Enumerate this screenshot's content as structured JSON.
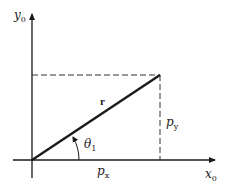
{
  "diagram": {
    "type": "vector-components",
    "axes": {
      "y_label": {
        "main": "y",
        "sub": "0"
      },
      "x_label": {
        "main": "x",
        "sub": "0"
      }
    },
    "vector_label": "r",
    "angle_label": {
      "main": "θ",
      "sub": "1"
    },
    "component_x": {
      "main": "p",
      "sub": "x"
    },
    "component_y": {
      "main": "p",
      "sub": "y"
    },
    "colors": {
      "line": "#1a1a1a",
      "dash": "#333333",
      "background": "#ffffff"
    }
  }
}
